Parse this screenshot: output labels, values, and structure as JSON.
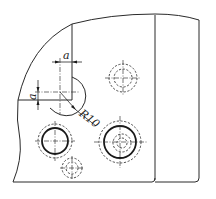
{
  "drawing": {
    "type": "engineering-drawing",
    "description": "Plate corner with fillet and hole pattern",
    "dimensions": {
      "horizontal_offset_label": "a",
      "vertical_offset_label": "a",
      "radius_label": "R10"
    },
    "holes": [
      {
        "id": "corner-fillet-hole",
        "cx": 63,
        "cy": 100,
        "style": "arc-radius"
      },
      {
        "id": "upper-right-hole",
        "cx": 123,
        "cy": 78,
        "style": "dashed-concentric"
      },
      {
        "id": "lower-left-hole",
        "cx": 55,
        "cy": 141,
        "style": "solid-with-dashed"
      },
      {
        "id": "lower-center-hole",
        "cx": 72,
        "cy": 168,
        "style": "dashed-concentric"
      },
      {
        "id": "lower-right-hole",
        "cx": 120,
        "cy": 142,
        "style": "solid-with-dashed-inner"
      }
    ],
    "colors": {
      "line": "#2a2a2a",
      "background": "#ffffff"
    }
  }
}
